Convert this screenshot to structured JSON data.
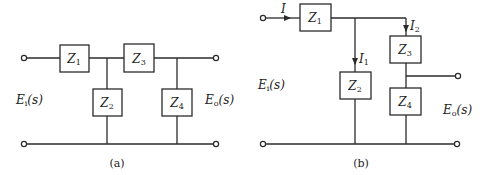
{
  "diagram_a": {
    "caption": "(a)",
    "input_label": {
      "main": "E",
      "sub": "i",
      "rest": "(s)"
    },
    "output_label": {
      "main": "E",
      "sub": "o",
      "rest": "(s)"
    },
    "impedances": [
      {
        "main": "Z",
        "sub": "1"
      },
      {
        "main": "Z",
        "sub": "2"
      },
      {
        "main": "Z",
        "sub": "3"
      },
      {
        "main": "Z",
        "sub": "4"
      }
    ]
  },
  "diagram_b": {
    "caption": "(b)",
    "input_label": {
      "main": "E",
      "sub": "i",
      "rest": "(s)"
    },
    "output_label": {
      "main": "E",
      "sub": "o",
      "rest": "(s)"
    },
    "impedances": [
      {
        "main": "Z",
        "sub": "1"
      },
      {
        "main": "Z",
        "sub": "2"
      },
      {
        "main": "Z",
        "sub": "3"
      },
      {
        "main": "Z",
        "sub": "4"
      }
    ],
    "currents": [
      {
        "main": "I",
        "sub": ""
      },
      {
        "main": "I",
        "sub": "1"
      },
      {
        "main": "I",
        "sub": "2"
      }
    ]
  }
}
